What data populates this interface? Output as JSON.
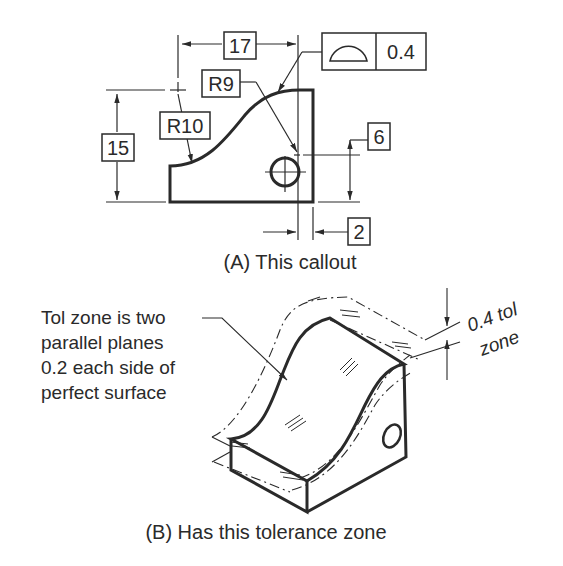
{
  "figure": {
    "view_a": {
      "caption": "(A) This callout",
      "dimensions": {
        "width_17": "17",
        "height_15": "15",
        "radius_r9": "R9",
        "radius_r10": "R10",
        "hole_height_6": "6",
        "hole_offset_2": "2"
      },
      "feature_control_frame": {
        "symbol": "profile-of-a-surface",
        "tolerance": "0.4"
      }
    },
    "view_b": {
      "caption": "(B) Has this tolerance zone",
      "note_lines": [
        "Tol zone is two",
        "parallel planes",
        "0.2 each side of",
        "perfect surface"
      ],
      "zone_label_line1": "0.4 tol",
      "zone_label_line2": "zone"
    }
  }
}
